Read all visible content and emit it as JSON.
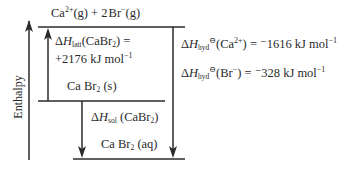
{
  "diagram": {
    "type": "enthalpy-level-diagram",
    "axis_label": "Enthalpy",
    "levels": {
      "top": {
        "species": "Ca",
        "species_charge": "2+",
        "species_state": "(g)",
        "plus": "+",
        "coef": "2",
        "species2": "Br",
        "species2_charge": "−",
        "species2_state": "(g)"
      },
      "middle": {
        "formula": "Ca Br",
        "subscript": "2",
        "state": "(s)"
      },
      "bottom": {
        "formula": "Ca Br",
        "subscript": "2",
        "state": "(aq)"
      }
    },
    "lattice": {
      "delta": "Δ",
      "H": "H",
      "sub": "latt",
      "compound": "(CaBr",
      "compound_sub": "2",
      "compound_close": ") =",
      "value": "+2176 kJ mol",
      "exp": "−1"
    },
    "solution": {
      "delta": "Δ",
      "H": "H",
      "sub": "sol",
      "compound": " (CaBr",
      "compound_sub": "2",
      "compound_close": ")"
    },
    "hydration_ca": {
      "delta": "Δ",
      "H": "H",
      "sub": "hyd",
      "standard": "⊖",
      "ion": "(Ca",
      "ion_charge": "2+",
      "rest": ") = ",
      "value": "⁻1616 kJ mol",
      "exp": "−1"
    },
    "hydration_br": {
      "delta": "Δ",
      "H": "H",
      "sub": "hyd",
      "standard": "⊖",
      "ion": "(Br",
      "ion_charge": "−",
      "rest": ") = ",
      "value": "⁻328 kJ mol",
      "exp": "−1"
    },
    "colors": {
      "line": "#2a2a2a",
      "text": "#2a2a2a",
      "background": "#ffffff"
    }
  }
}
